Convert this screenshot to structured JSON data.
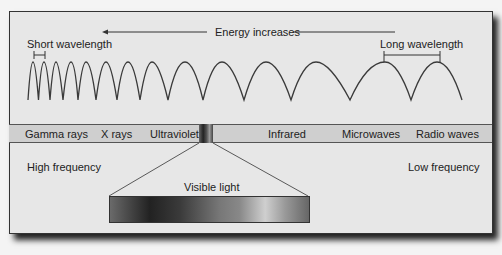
{
  "diagram": {
    "title_arrow": "Energy increases",
    "short_wavelength": "Short wavelength",
    "long_wavelength": "Long wavelength",
    "high_frequency": "High frequency",
    "low_frequency": "Low frequency",
    "visible_light": "Visible light",
    "bands": [
      {
        "label": "Gamma rays",
        "x": 16
      },
      {
        "label": "X rays",
        "x": 101
      },
      {
        "label": "Ultraviolet",
        "x": 150
      },
      {
        "label": "Infrared",
        "x": 268
      },
      {
        "label": "Microwaves",
        "x": 342
      },
      {
        "label": "Radio waves",
        "x": 416
      }
    ],
    "colors": {
      "panel": "#e7e7e7",
      "band": "#cfcfcf",
      "line": "#333333"
    }
  }
}
